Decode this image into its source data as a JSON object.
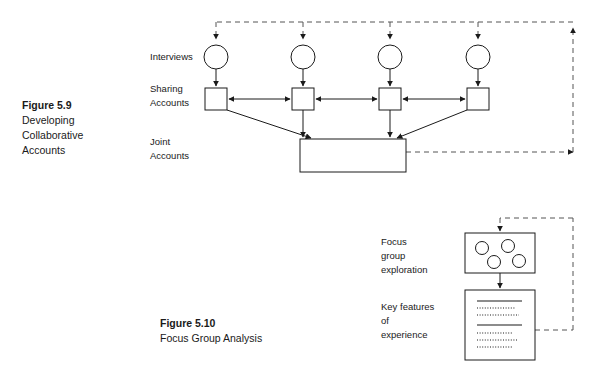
{
  "page": {
    "width": 599,
    "height": 383,
    "background": "#ffffff",
    "ink_color": "#1a1a1a",
    "dashed_color": "#555555"
  },
  "figure_59": {
    "caption": {
      "number": "Figure 5.9",
      "lines": [
        "Developing",
        "Collaborative",
        "Accounts"
      ]
    },
    "row_labels": [
      {
        "id": "interviews",
        "lines": [
          "Interviews"
        ]
      },
      {
        "id": "sharing-accounts",
        "lines": [
          "Sharing",
          "Accounts"
        ]
      },
      {
        "id": "joint-accounts",
        "lines": [
          "Joint",
          "Accounts"
        ]
      }
    ],
    "interview_nodes": [
      {
        "id": "interview-1",
        "cx": 216,
        "cy": 57,
        "r": 12
      },
      {
        "id": "interview-2",
        "cx": 303,
        "cy": 57,
        "r": 12
      },
      {
        "id": "interview-3",
        "cx": 390,
        "cy": 57,
        "r": 12
      },
      {
        "id": "interview-4",
        "cx": 478,
        "cy": 57,
        "r": 12
      }
    ],
    "sharing_nodes": [
      {
        "id": "sharing-1",
        "x": 205,
        "y": 88,
        "w": 22,
        "h": 22
      },
      {
        "id": "sharing-2",
        "x": 292,
        "y": 88,
        "w": 22,
        "h": 22
      },
      {
        "id": "sharing-3",
        "x": 379,
        "y": 88,
        "w": 22,
        "h": 22
      },
      {
        "id": "sharing-4",
        "x": 467,
        "y": 88,
        "w": 22,
        "h": 22
      }
    ],
    "joint_node": {
      "id": "joint-accounts-box",
      "x": 300,
      "y": 139,
      "w": 106,
      "h": 33
    },
    "feedback_loop": {
      "top_y": 22,
      "right_x": 573,
      "bottom_y": 152,
      "left_x": 216,
      "description": "dashed feedback from joint accounts back to all interviews"
    }
  },
  "figure_510": {
    "caption": {
      "number": "Figure 5.10",
      "lines": [
        "Focus Group Analysis"
      ]
    },
    "row_labels": [
      {
        "id": "focus-group-exploration",
        "lines": [
          "Focus",
          "group",
          "exploration"
        ]
      },
      {
        "id": "key-features-of-experience",
        "lines": [
          "Key features",
          "of",
          "experience"
        ]
      }
    ],
    "focus_group_box": {
      "id": "focus-group-box",
      "x": 465,
      "y": 233,
      "w": 70,
      "h": 40,
      "participants": [
        {
          "cx": 482,
          "cy": 248,
          "r": 6.5
        },
        {
          "cx": 508,
          "cy": 246,
          "r": 6.5
        },
        {
          "cx": 494,
          "cy": 262,
          "r": 6.5
        },
        {
          "cx": 519,
          "cy": 261,
          "r": 6.5
        }
      ]
    },
    "key_features_box": {
      "id": "key-features-box",
      "x": 465,
      "y": 290,
      "w": 70,
      "h": 70,
      "content_rows": [
        {
          "type": "rule",
          "x1": 477,
          "x2": 522,
          "y": 301
        },
        {
          "type": "dots",
          "x1": 477,
          "x2": 515,
          "y": 308
        },
        {
          "type": "dots",
          "x1": 477,
          "x2": 519,
          "y": 315
        },
        {
          "type": "rule",
          "x1": 477,
          "x2": 522,
          "y": 325
        },
        {
          "type": "dots",
          "x1": 477,
          "x2": 512,
          "y": 333
        },
        {
          "type": "dots",
          "x1": 477,
          "x2": 517,
          "y": 340
        },
        {
          "type": "dots",
          "x1": 477,
          "x2": 512,
          "y": 347
        }
      ]
    },
    "feedback_loop": {
      "top_y": 218,
      "right_x": 573,
      "bottom_y": 330,
      "left_x": 500,
      "description": "dashed feedback from key features back to focus group"
    }
  }
}
